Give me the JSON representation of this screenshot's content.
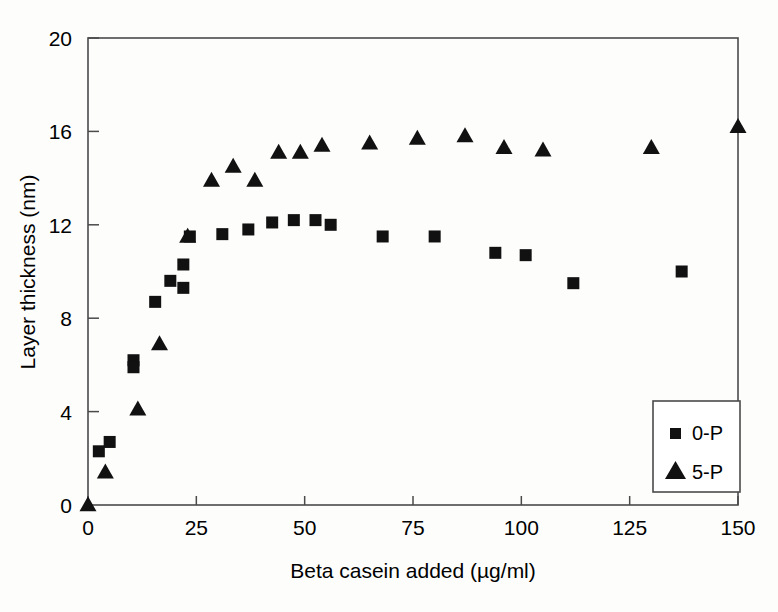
{
  "chart_data": {
    "type": "scatter",
    "title": "",
    "xlabel": "Beta casein added (µg/ml)",
    "ylabel": "Layer thickness (nm)",
    "xlim": [
      0,
      150
    ],
    "ylim": [
      0,
      20
    ],
    "xticks": [
      0,
      25,
      50,
      75,
      100,
      125,
      150
    ],
    "yticks": [
      0,
      4,
      8,
      12,
      16,
      20
    ],
    "xtick_labels": [
      "0",
      "25",
      "50",
      "75",
      "100",
      "125",
      "150"
    ],
    "ytick_labels": [
      "0",
      "4",
      "8",
      "12",
      "16",
      "20"
    ],
    "grid": false,
    "legend_position": "bottom-right",
    "series": [
      {
        "name": "0-P",
        "marker": "square",
        "color": "#111111",
        "points": [
          [
            2.5,
            2.3
          ],
          [
            5.0,
            2.7
          ],
          [
            10.5,
            6.2
          ],
          [
            10.5,
            5.9
          ],
          [
            15.5,
            8.7
          ],
          [
            19.0,
            9.6
          ],
          [
            22.0,
            10.3
          ],
          [
            22.0,
            9.3
          ],
          [
            23.5,
            11.5
          ],
          [
            31.0,
            11.6
          ],
          [
            37.0,
            11.8
          ],
          [
            42.5,
            12.1
          ],
          [
            47.5,
            12.2
          ],
          [
            52.5,
            12.2
          ],
          [
            56.0,
            12.0
          ],
          [
            68.0,
            11.5
          ],
          [
            80.0,
            11.5
          ],
          [
            94.0,
            10.8
          ],
          [
            101.0,
            10.7
          ],
          [
            112.0,
            9.5
          ],
          [
            137.0,
            10.0
          ]
        ]
      },
      {
        "name": "5-P",
        "marker": "triangle",
        "color": "#111111",
        "points": [
          [
            0.0,
            0.0
          ],
          [
            4.0,
            1.4
          ],
          [
            11.5,
            4.1
          ],
          [
            16.5,
            6.9
          ],
          [
            23.0,
            11.5
          ],
          [
            28.5,
            13.9
          ],
          [
            33.5,
            14.5
          ],
          [
            38.5,
            13.9
          ],
          [
            44.0,
            15.1
          ],
          [
            49.0,
            15.1
          ],
          [
            54.0,
            15.4
          ],
          [
            65.0,
            15.5
          ],
          [
            76.0,
            15.7
          ],
          [
            87.0,
            15.8
          ],
          [
            96.0,
            15.3
          ],
          [
            105.0,
            15.2
          ],
          [
            130.0,
            15.3
          ],
          [
            150.0,
            16.2
          ]
        ]
      }
    ]
  },
  "legend": {
    "entries": [
      {
        "label": "0-P",
        "marker": "square"
      },
      {
        "label": "5-P",
        "marker": "triangle"
      }
    ]
  }
}
